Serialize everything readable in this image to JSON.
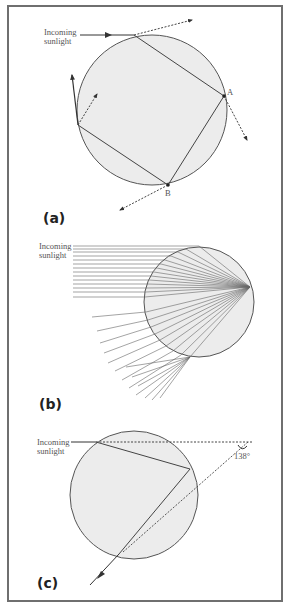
{
  "figure": {
    "colors": {
      "drop_fill": "#ececec",
      "drop_stroke": "#555555",
      "ray": "#444444",
      "frame": "#6f6f6f"
    }
  },
  "panels": [
    {
      "id": "a",
      "label": "(a)",
      "incoming_label_line1": "Incoming",
      "incoming_label_line2": "sunlight",
      "point_a": "A",
      "point_b": "B"
    },
    {
      "id": "b",
      "label": "(b)",
      "incoming_label_line1": "Incoming",
      "incoming_label_line2": "sunlight"
    },
    {
      "id": "c",
      "label": "(c)",
      "incoming_label_line1": "Incoming",
      "incoming_label_line2": "sunlight",
      "angle": "138°"
    }
  ]
}
